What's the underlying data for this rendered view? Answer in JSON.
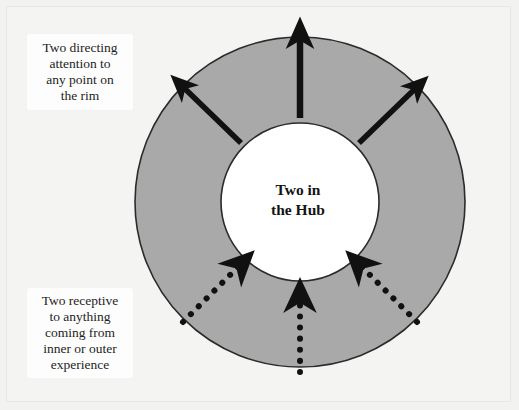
{
  "diagram": {
    "hub": {
      "label_line1": "Two in",
      "label_line2": "the Hub",
      "fill_color": "#ffffff",
      "stroke_color": "#2b2b2b"
    },
    "rim": {
      "fill_color": "#a9a9a9",
      "stroke_color": "#2b2b2b"
    },
    "captions": [
      {
        "id": "directing-attention",
        "lines": [
          "Two directing",
          "attention to",
          "any point on",
          "the rim"
        ]
      },
      {
        "id": "receptive",
        "lines": [
          "Two receptive",
          "to anything",
          "coming from",
          "inner or outer",
          "experience"
        ]
      }
    ],
    "arrows": {
      "outward_style": "solid",
      "inward_style": "dotted",
      "color": "#111111",
      "outward": [
        {
          "id": "arrow-out-up-left",
          "direction": "up-left",
          "angle_deg": 135
        },
        {
          "id": "arrow-out-up",
          "direction": "up",
          "angle_deg": 90
        },
        {
          "id": "arrow-out-up-right",
          "direction": "up-right",
          "angle_deg": 45
        }
      ],
      "inward": [
        {
          "id": "arrow-in-from-lower-left",
          "direction": "up-right",
          "angle_deg": 45,
          "dots": 7
        },
        {
          "id": "arrow-in-from-below",
          "direction": "up",
          "angle_deg": 90,
          "dots": 7
        },
        {
          "id": "arrow-in-from-lower-right",
          "direction": "up-left",
          "angle_deg": 135,
          "dots": 7
        }
      ]
    },
    "geometry": {
      "center_x": 300,
      "center_y": 202,
      "outer_radius": 165,
      "inner_radius": 79
    }
  }
}
